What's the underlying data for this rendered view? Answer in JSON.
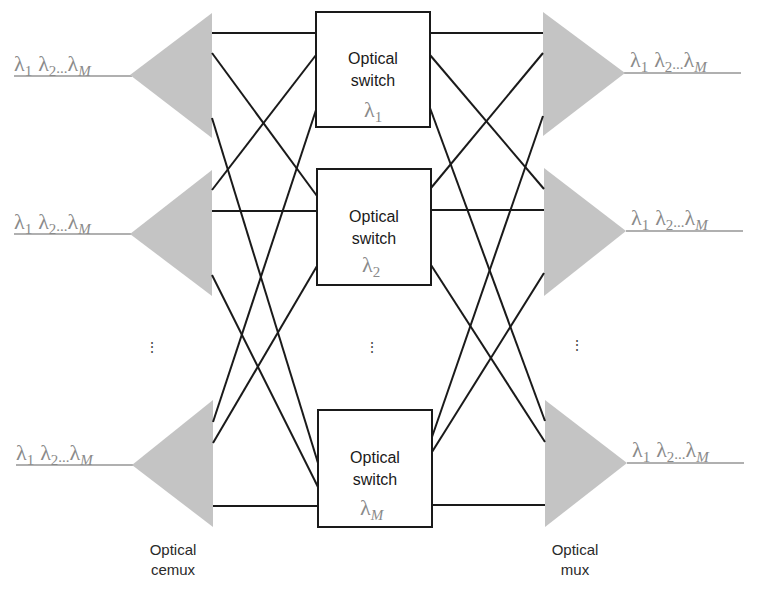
{
  "diagram": {
    "title": "",
    "colors": {
      "triangle_fill": "#c4c4c4",
      "fiber_line": "#b0b0b0",
      "connection_line": "#1a1a1a",
      "wavelength_text": "#8a8a8a",
      "box_stroke": "#1a1a1a"
    },
    "inputs": [
      {
        "wavelengths": {
          "l1": "λ",
          "s1": "1",
          "l2": "λ",
          "s2": "2",
          "ellipsis": "...",
          "lM": "λ",
          "sM": "M"
        }
      },
      {
        "wavelengths": {
          "l1": "λ",
          "s1": "1",
          "l2": "λ",
          "s2": "2",
          "ellipsis": "...",
          "lM": "λ",
          "sM": "M"
        }
      },
      {
        "wavelengths": {
          "l1": "λ",
          "s1": "1",
          "l2": "λ",
          "s2": "2",
          "ellipsis": "...",
          "lM": "λ",
          "sM": "M"
        }
      }
    ],
    "outputs": [
      {
        "wavelengths": {
          "l1": "λ",
          "s1": "1",
          "l2": "λ",
          "s2": "2",
          "ellipsis": "...",
          "lM": "λ",
          "sM": "M"
        }
      },
      {
        "wavelengths": {
          "l1": "λ",
          "s1": "1",
          "l2": "λ",
          "s2": "2",
          "ellipsis": "...",
          "lM": "λ",
          "sM": "M"
        }
      },
      {
        "wavelengths": {
          "l1": "λ",
          "s1": "1",
          "l2": "λ",
          "s2": "2",
          "ellipsis": "...",
          "lM": "λ",
          "sM": "M"
        }
      }
    ],
    "switches": [
      {
        "line1": "Optical",
        "line2": "switch",
        "lambda": "λ",
        "sub": "1"
      },
      {
        "line1": "Optical",
        "line2": "switch",
        "lambda": "λ",
        "sub": "2"
      },
      {
        "line1": "Optical",
        "line2": "switch",
        "lambda": "λ",
        "sub": "M"
      }
    ],
    "ellipsis_vertical": "⋮",
    "labels": {
      "demux_line1": "Optical",
      "demux_line2": "cemux",
      "mux_line1": "Optical",
      "mux_line2": "mux"
    }
  }
}
